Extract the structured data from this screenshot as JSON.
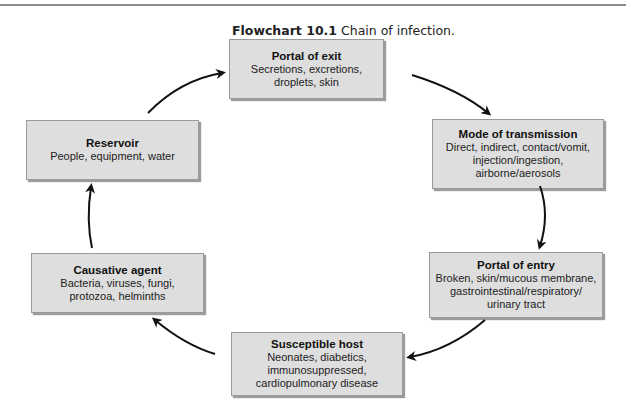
{
  "caption": {
    "label": "Flowchart 10.1",
    "text": " Chain of infection."
  },
  "nodes": [
    {
      "id": "portal-of-exit",
      "title": "Portal of exit",
      "lines": [
        "Secretions, excretions,",
        "droplets, skin"
      ]
    },
    {
      "id": "mode-of-transmission",
      "title": "Mode of transmission",
      "lines": [
        "Direct, indirect, contact/vomit,",
        "injection/ingestion,",
        "airborne/aerosols"
      ]
    },
    {
      "id": "portal-of-entry",
      "title": "Portal of entry",
      "lines": [
        "Broken, skin/mucous membrane,",
        "gastrointestinal/respiratory/",
        "urinary tract"
      ]
    },
    {
      "id": "susceptible-host",
      "title": "Susceptible host",
      "lines": [
        "Neonates, diabetics,",
        "immunosuppressed,",
        "cardiopulmonary disease"
      ]
    },
    {
      "id": "causative-agent",
      "title": "Causative agent",
      "lines": [
        "Bacteria, viruses, fungi,",
        "protozoa, helminths"
      ]
    },
    {
      "id": "reservoir",
      "title": "Reservoir",
      "lines": [
        "People, equipment, water"
      ]
    }
  ],
  "edges": [
    {
      "from": "reservoir",
      "to": "portal-of-exit"
    },
    {
      "from": "portal-of-exit",
      "to": "mode-of-transmission"
    },
    {
      "from": "mode-of-transmission",
      "to": "portal-of-entry"
    },
    {
      "from": "portal-of-entry",
      "to": "susceptible-host"
    },
    {
      "from": "susceptible-host",
      "to": "causative-agent"
    },
    {
      "from": "causative-agent",
      "to": "reservoir"
    }
  ],
  "colors": {
    "box_fill": "#dedede",
    "box_border": "#9a9a9a",
    "arrow": "#111111"
  }
}
